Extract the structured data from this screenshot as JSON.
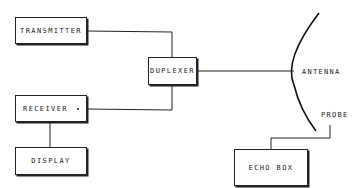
{
  "diagram": {
    "type": "block-diagram",
    "blocks": {
      "transmitter": "TRANSMITTER",
      "duplexer": "DUPLEXER",
      "receiver": "RECEIVER",
      "display": "DISPLAY",
      "echo_box": "ECHO BOX"
    },
    "labels": {
      "antenna": "ANTENNA",
      "probe": "PROBE"
    },
    "connections": [
      {
        "from": "TRANSMITTER",
        "to": "DUPLEXER"
      },
      {
        "from": "DUPLEXER",
        "to": "RECEIVER"
      },
      {
        "from": "DUPLEXER",
        "to": "ANTENNA"
      },
      {
        "from": "RECEIVER",
        "to": "DISPLAY"
      },
      {
        "from": "PROBE",
        "to": "ECHO BOX"
      }
    ],
    "line_color": "#222222"
  }
}
